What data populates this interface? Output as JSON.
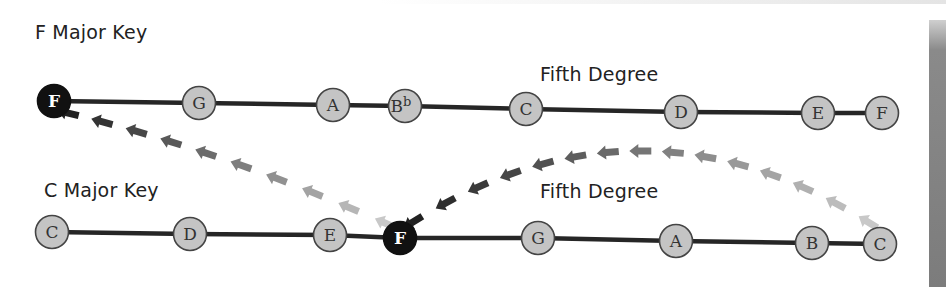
{
  "diagram": {
    "title_top": "F Major Key",
    "title_bottom": "C Major Key",
    "fifth_label_top": "Fifth Degree",
    "fifth_label_bottom": "Fifth Degree",
    "colors": {
      "line": "#262626",
      "node_fill": "#c4c4c4",
      "node_stroke": "#444444",
      "tonic_fill": "#111111",
      "tonic_text": "#ffffff",
      "note_text": "#333333",
      "arrow_dark": "#222222",
      "arrow_light": "#c8c8c8"
    },
    "top_scale": {
      "key": "F Major",
      "notes": [
        {
          "label": "F",
          "x": 54,
          "y": 101,
          "tonic": true
        },
        {
          "label": "G",
          "x": 199,
          "y": 103,
          "tonic": false
        },
        {
          "label": "A",
          "x": 333,
          "y": 105,
          "tonic": false
        },
        {
          "label": "B",
          "accidental": "b",
          "x": 405,
          "y": 106,
          "tonic": false
        },
        {
          "label": "C",
          "x": 526,
          "y": 109,
          "tonic": false
        },
        {
          "label": "D",
          "x": 681,
          "y": 112,
          "tonic": false
        },
        {
          "label": "E",
          "x": 818,
          "y": 113,
          "tonic": false
        },
        {
          "label": "F",
          "x": 882,
          "y": 113,
          "tonic": false
        }
      ]
    },
    "bottom_scale": {
      "key": "C Major",
      "notes": [
        {
          "label": "C",
          "x": 52,
          "y": 232,
          "tonic": false
        },
        {
          "label": "D",
          "x": 190,
          "y": 234,
          "tonic": false
        },
        {
          "label": "E",
          "x": 330,
          "y": 235,
          "tonic": false
        },
        {
          "label": "F",
          "x": 400,
          "y": 238,
          "tonic": true
        },
        {
          "label": "G",
          "x": 538,
          "y": 238,
          "tonic": false
        },
        {
          "label": "A",
          "x": 676,
          "y": 241,
          "tonic": false
        },
        {
          "label": "B",
          "x": 812,
          "y": 243,
          "tonic": false
        },
        {
          "label": "C",
          "x": 880,
          "y": 244,
          "tonic": false
        }
      ]
    },
    "arrow_paths": [
      {
        "name": "bottom-F-to-top-F",
        "from": [
          385,
          223
        ],
        "to": [
          68,
          113
        ],
        "count": 10,
        "curve": [
          220,
          150
        ]
      },
      {
        "name": "bottom-C-to-bottom-F",
        "from": [
          868,
          222
        ],
        "to": [
          413,
          222
        ],
        "count": 15,
        "curve": [
          640,
          80
        ]
      }
    ]
  }
}
